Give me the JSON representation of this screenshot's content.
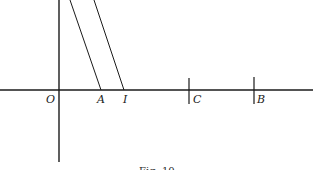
{
  "figure": {
    "caption": "Fig. 10",
    "points": {
      "origin": "O",
      "a": "A",
      "i": "I",
      "c": "C",
      "b": "B"
    }
  }
}
